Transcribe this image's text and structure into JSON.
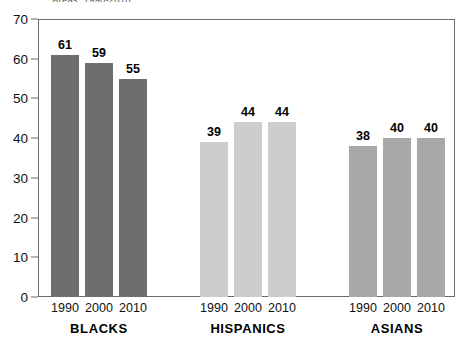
{
  "chart_data": {
    "type": "bar",
    "title": "Areas, 1990-2010",
    "title_visible_fragment": "Areas, 1990-2010",
    "xlabel": "",
    "ylabel": "",
    "ylim": [
      0,
      70
    ],
    "ytick_step": 10,
    "yticks": [
      70,
      60,
      50,
      40,
      30,
      20,
      10,
      0
    ],
    "categories": [
      "1990",
      "2000",
      "2010"
    ],
    "grid": false,
    "legend": "none",
    "groups": [
      {
        "name": "BLACKS",
        "color": "#6e6e6e",
        "values": [
          61,
          59,
          55
        ],
        "bars": [
          {
            "year": "1990",
            "value": 61
          },
          {
            "year": "2000",
            "value": 59
          },
          {
            "year": "2010",
            "value": 55
          }
        ]
      },
      {
        "name": "HISPANICS",
        "color": "#cdcdcd",
        "values": [
          39,
          44,
          44
        ],
        "bars": [
          {
            "year": "1990",
            "value": 39
          },
          {
            "year": "2000",
            "value": 44
          },
          {
            "year": "2010",
            "value": 44
          }
        ]
      },
      {
        "name": "ASIANS",
        "color": "#a8a8a8",
        "values": [
          38,
          40,
          40
        ],
        "bars": [
          {
            "year": "1990",
            "value": 38
          },
          {
            "year": "2000",
            "value": 40
          },
          {
            "year": "2010",
            "value": 40
          }
        ]
      }
    ]
  },
  "axis": {
    "frame_color": "#6a6a6a"
  }
}
